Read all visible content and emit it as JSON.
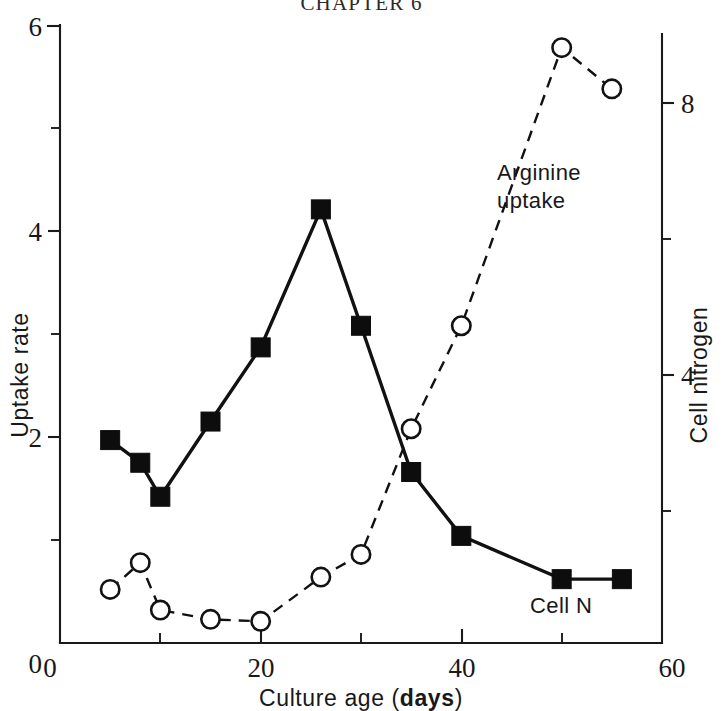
{
  "page": {
    "running_head": "CHAPTER 6"
  },
  "chart_data": {
    "type": "line",
    "title": "",
    "subtitle": "",
    "xlabel": "Culture age (days)",
    "xlabel_plain": "Culture age (",
    "xlabel_bold": "days",
    "xlabel_tail": ")",
    "ylabel_left": "Uptake rate",
    "ylabel_right": "Cell nitrogen",
    "xlim": [
      0,
      60
    ],
    "ylim_left": [
      0,
      6
    ],
    "ylim_right": [
      0,
      8.6
    ],
    "grid": false,
    "legend_position": "inline-annotation",
    "x_ticks_major": [
      0,
      20,
      40,
      60
    ],
    "x_ticks_minor": [
      10,
      30,
      50
    ],
    "x_tick_labels": [
      "0",
      "20",
      "40",
      "60"
    ],
    "y_left_ticks_major": [
      0,
      2,
      4,
      6
    ],
    "y_left_ticks_minor": [
      1,
      3,
      5
    ],
    "y_left_tick_labels": [
      "0",
      "2",
      "4",
      "6"
    ],
    "y_right_ticks_major": [
      4,
      8
    ],
    "y_right_ticks_minor": [
      2,
      6
    ],
    "y_right_tick_labels": [
      "4",
      "8"
    ],
    "annotations": [
      {
        "text": "Arginine",
        "x": 43.5,
        "y": 3.05
      },
      {
        "text": "uptake",
        "x": 43.5,
        "y": 2.68
      },
      {
        "text": "Cell N",
        "x": 51.5,
        "y": 0.36
      }
    ],
    "series": [
      {
        "name": "Cell N",
        "axis": "left",
        "marker": "filled-square",
        "line_style": "solid",
        "x": [
          5,
          8,
          10,
          15,
          20,
          26,
          30,
          35,
          40,
          50,
          56
        ],
        "values": [
          1.97,
          1.75,
          1.42,
          2.15,
          2.87,
          4.21,
          3.08,
          1.66,
          1.04,
          0.62,
          0.62
        ]
      },
      {
        "name": "Arginine uptake",
        "axis": "right",
        "marker": "open-circle",
        "line_style": "dashed",
        "x": [
          5,
          8,
          10,
          15,
          20,
          26,
          30,
          35,
          40,
          50,
          55
        ],
        "values": [
          0.78,
          1.12,
          0.48,
          0.35,
          0.32,
          0.96,
          1.28,
          3.18,
          4.8,
          8.5,
          7.95
        ],
        "values_left_scale": [
          0.52,
          0.78,
          0.32,
          0.23,
          0.21,
          0.64,
          0.86,
          2.08,
          3.08,
          5.78,
          5.38
        ]
      }
    ]
  }
}
